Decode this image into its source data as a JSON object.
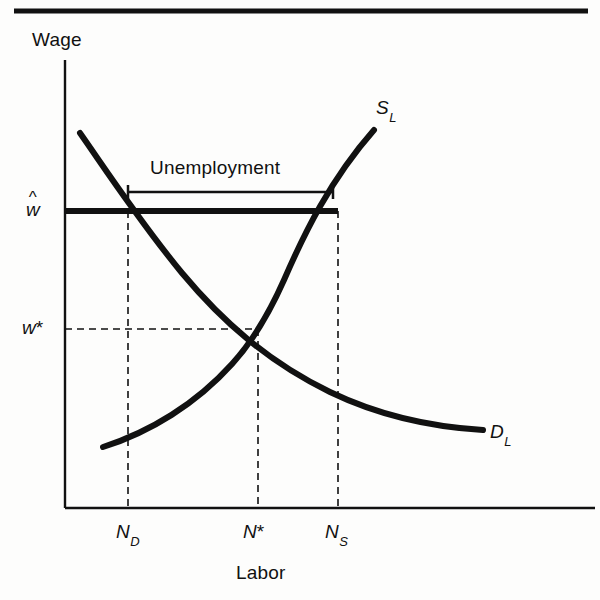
{
  "figure": {
    "kind": "labor-market-supply-demand-diagram",
    "background_color": "#fdfdfc",
    "ink_color": "#111111",
    "axes": {
      "y_axis_title": "Wage",
      "x_axis_title": "Labor",
      "y_axis_x_px": 65,
      "y_axis_top_px": 60,
      "x_axis_y_px": 508,
      "x_axis_right_px": 595
    },
    "top_rule": {
      "name": "page-top-rule",
      "x1": 14,
      "x2": 588,
      "y": 11,
      "thickness": 5
    },
    "value_labels": {
      "wage_rigid": "w",
      "wage_rigid_accent": "^",
      "wage_equilibrium": "w",
      "wage_equilibrium_star": "*"
    },
    "tick_labels": {
      "labor_demanded": "N",
      "labor_demanded_sub": "D",
      "labor_equilibrium": "N",
      "labor_equilibrium_star": "*",
      "labor_supplied": "N",
      "labor_supplied_sub": "S"
    },
    "curves": [
      {
        "name": "labor-supply-curve",
        "label": "S",
        "label_sub": "L",
        "label_x": 376,
        "label_y": 98,
        "stroke_width": 6,
        "path": "M 103 447 C 150 432, 196 404, 232 364 C 252 342, 268 316, 284 280 C 304 234, 330 180, 374 130"
      },
      {
        "name": "labor-demand-curve",
        "label": "D",
        "label_sub": "L",
        "label_x": 490,
        "label_y": 422,
        "stroke_width": 6,
        "path": "M 80 133 C 108 173, 140 222, 182 273 C 222 321, 268 362, 330 392 C 382 417, 432 427, 483 430"
      }
    ],
    "rigid_wage_line": {
      "name": "rigid-wage-line",
      "x1": 65,
      "x2": 338,
      "y": 211,
      "stroke_width": 6
    },
    "equilibrium": {
      "name": "equilibrium-point",
      "x": 258,
      "y": 329
    },
    "guides": [
      {
        "name": "guide-nd-vertical",
        "x1": 128,
        "y1": 211,
        "x2": 128,
        "y2": 508
      },
      {
        "name": "guide-ns-vertical",
        "x1": 338,
        "y1": 211,
        "x2": 338,
        "y2": 508
      },
      {
        "name": "guide-nstar-vertical",
        "x1": 258,
        "y1": 329,
        "x2": 258,
        "y2": 508
      },
      {
        "name": "guide-wstar-horizontal",
        "x1": 65,
        "y1": 329,
        "x2": 258,
        "y2": 329
      }
    ],
    "unemployment_bracket": {
      "name": "unemployment-bracket",
      "label": "Unemployment",
      "label_x": 150,
      "label_y": 158,
      "x1": 128,
      "x2": 333,
      "y": 192,
      "cap_height": 14,
      "stroke_width": 2.5
    },
    "label_positions": {
      "wage_title_x": 32,
      "wage_title_y": 30,
      "labor_title_x": 236,
      "labor_title_y": 563,
      "w_hat_x": 26,
      "w_hat_y": 200,
      "w_star_x": 22,
      "w_star_y": 318,
      "nd_x": 116,
      "nd_y": 522,
      "nstar_x": 243,
      "nstar_y": 522,
      "ns_x": 325,
      "ns_y": 522
    }
  }
}
